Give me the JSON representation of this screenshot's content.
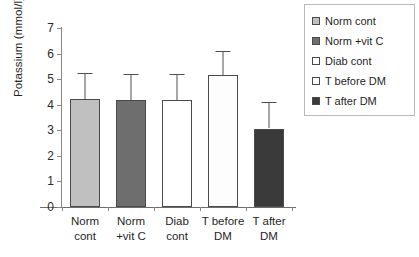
{
  "chart_data": {
    "type": "bar",
    "title": "",
    "xlabel": "",
    "ylabel": "Potassium (mmol/l)",
    "ylim": [
      0,
      7
    ],
    "ytick_labels": [
      "7",
      "6",
      "5",
      "4",
      "3",
      "2",
      "1",
      "0"
    ],
    "ytick_values": [
      7,
      6,
      5,
      4,
      3,
      2,
      1,
      0
    ],
    "grid": false,
    "legend_position": "top-right",
    "categories": [
      {
        "line1": "Norm",
        "line2": "cont"
      },
      {
        "line1": "Norm",
        "line2": "+vit C"
      },
      {
        "line1": "Diab",
        "line2": "cont"
      },
      {
        "line1": "T before",
        "line2": "DM"
      },
      {
        "line1": "T after",
        "line2": "DM"
      }
    ],
    "values": [
      4.22,
      4.18,
      4.19,
      5.15,
      3.07
    ],
    "error_high": [
      5.25,
      5.2,
      5.2,
      6.1,
      4.1
    ],
    "bar_colors": [
      "#c0c0c0",
      "#6e6e6e",
      "#ffffff",
      "#fdfdfd",
      "#3a3a3a"
    ],
    "legend_entries": [
      {
        "label": "Norm cont",
        "color": "#c0c0c0"
      },
      {
        "label": "Norm +vit C",
        "color": "#6e6e6e"
      },
      {
        "label": "Diab cont",
        "color": "#ffffff"
      },
      {
        "label": "T before DM",
        "color": "#fdfdfd"
      },
      {
        "label": "T after DM",
        "color": "#3a3a3a"
      }
    ]
  }
}
